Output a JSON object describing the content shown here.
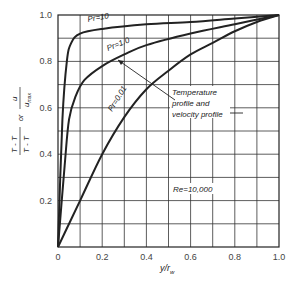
{
  "chart_data": {
    "type": "line",
    "title": "",
    "xlabel": "y/r_w",
    "ylabel": "(T_w - T)/(T_w - T_c) or u/u_max",
    "xlim": [
      0,
      1.0
    ],
    "ylim": [
      0,
      1.0
    ],
    "grid": true,
    "x_ticks": [
      "0",
      "0.2",
      "0.4",
      "0.6",
      "0.8",
      "1.0"
    ],
    "y_ticks": [
      "0.2",
      "0.4",
      "0.6",
      "0.8",
      "1.0"
    ],
    "series": [
      {
        "name": "Pr=10",
        "x": [
          0,
          0.02,
          0.04,
          0.06,
          0.1,
          0.2,
          0.4,
          0.6,
          0.8,
          1.0
        ],
        "y": [
          0,
          0.55,
          0.8,
          0.88,
          0.92,
          0.94,
          0.96,
          0.97,
          0.985,
          1.0
        ]
      },
      {
        "name": "Pr=1.0",
        "x": [
          0,
          0.03,
          0.05,
          0.08,
          0.12,
          0.2,
          0.3,
          0.4,
          0.6,
          0.8,
          1.0
        ],
        "y": [
          0,
          0.35,
          0.55,
          0.65,
          0.72,
          0.78,
          0.83,
          0.87,
          0.92,
          0.96,
          1.0
        ]
      },
      {
        "name": "Pr=0.01",
        "x": [
          0,
          0.1,
          0.2,
          0.3,
          0.4,
          0.5,
          0.6,
          0.7,
          0.8,
          0.9,
          1.0
        ],
        "y": [
          0,
          0.2,
          0.4,
          0.56,
          0.68,
          0.76,
          0.83,
          0.88,
          0.93,
          0.97,
          1.0
        ]
      }
    ],
    "annotations": [
      {
        "text": "Temperature profile and velocity profile",
        "target": "Pr=1.0 and Pr=0.01 curves"
      },
      {
        "text": "Re=10,000"
      }
    ]
  },
  "labels": {
    "pr10": "Pr=10",
    "pr1": "Pr=1.0",
    "pr001": "Pr=0.01",
    "annot1": "Temperature",
    "annot2": "profile and",
    "annot3": "velocity profile",
    "re": "Re=10,000",
    "xlabel": "y/r",
    "xlabel_sub": "w",
    "ylabel_left_num": "T - T",
    "ylabel_left_den": "T - T",
    "ylabel_or": "or",
    "ylabel_right_num": "u",
    "ylabel_right_den": "u",
    "ylabel_right_sub": "max"
  }
}
